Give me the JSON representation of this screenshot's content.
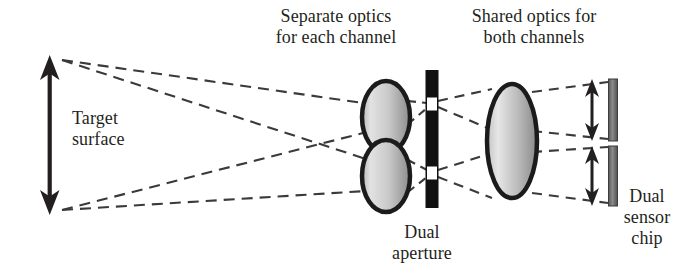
{
  "figure": {
    "type": "optical-ray-diagram",
    "background_color": "#ffffff",
    "ink_color": "#231f20",
    "lens_fill_light": "#d9d9d9",
    "lens_fill_dark": "#8c8c8c",
    "aperture_bar_color": "#111111",
    "aperture_slit_color": "#ffffff",
    "sensor_bar_color": "#6e6e6e",
    "ray_style": "dashed"
  },
  "labels": {
    "separate_optics": "Separate optics\nfor each channel",
    "shared_optics": "Shared optics for\nboth channels",
    "target_surface": "Target\nsurface",
    "dual_aperture": "Dual\naperture",
    "dual_sensor_chip": "Dual\nsensor\nchip"
  },
  "components": [
    {
      "name": "target-surface-arrow",
      "kind": "double-headed-arrow",
      "x": 50,
      "y_top": 58,
      "y_bottom": 212
    },
    {
      "name": "separate-optics-lens-upper",
      "kind": "ellipse-lens",
      "cx": 386,
      "cy": 117,
      "rx": 24,
      "ry": 36
    },
    {
      "name": "separate-optics-lens-lower",
      "kind": "ellipse-lens",
      "cx": 386,
      "cy": 176,
      "rx": 24,
      "ry": 36
    },
    {
      "name": "dual-aperture-bar",
      "kind": "opaque-bar",
      "cx": 432,
      "y_top": 70,
      "y_bottom": 208,
      "width": 13
    },
    {
      "name": "aperture-slit-upper",
      "kind": "slit",
      "cx": 432,
      "cy": 104,
      "width": 11,
      "height": 14
    },
    {
      "name": "aperture-slit-lower",
      "kind": "slit",
      "cx": 432,
      "cy": 173,
      "width": 11,
      "height": 14
    },
    {
      "name": "shared-optics-lens",
      "kind": "ellipse-lens",
      "cx": 512,
      "cy": 141,
      "rx": 25,
      "ry": 57
    },
    {
      "name": "sensor-bar-upper",
      "kind": "sensor-bar",
      "cx": 613,
      "y_top": 79,
      "y_bottom": 141,
      "width": 9
    },
    {
      "name": "sensor-bar-lower",
      "kind": "sensor-bar",
      "cx": 613,
      "y_top": 146,
      "y_bottom": 206,
      "width": 9
    },
    {
      "name": "sensor-extent-arrow-upper",
      "kind": "double-headed-arrow",
      "x": 592,
      "y_top": 81,
      "y_bottom": 139
    },
    {
      "name": "sensor-extent-arrow-lower",
      "kind": "double-headed-arrow",
      "x": 592,
      "y_top": 148,
      "y_bottom": 204
    }
  ],
  "rays": [
    {
      "name": "ray-top-to-upper-lens-top",
      "points": "62,60 362,104"
    },
    {
      "name": "ray-top-to-lower-lens-top",
      "points": "62,60 364,158"
    },
    {
      "name": "ray-bottom-to-upper-lens-bottom",
      "points": "62,210 362,134"
    },
    {
      "name": "ray-bottom-to-lower-lens-bottom",
      "points": "62,210 364,190"
    },
    {
      "name": "ray-upper-lens-to-slit-upper",
      "points": "410,104 426,104"
    },
    {
      "name": "ray-upper-lens-to-slit-upper-b",
      "points": "410,122 426,107"
    },
    {
      "name": "ray-lower-lens-to-slit-lower",
      "points": "410,162 426,170"
    },
    {
      "name": "ray-lower-lens-to-slit-lower-b",
      "points": "410,190 426,176"
    },
    {
      "name": "ray-slit-upper-to-shared-lens-top",
      "points": "438,102 489,88"
    },
    {
      "name": "ray-slit-upper-to-shared-lens-mid",
      "points": "438,106 489,128"
    },
    {
      "name": "ray-slit-lower-to-shared-lens-mid",
      "points": "438,170 489,154"
    },
    {
      "name": "ray-slit-lower-to-shared-lens-bottom",
      "points": "438,176 489,196"
    },
    {
      "name": "ray-shared-lens-to-sensor-upper-top",
      "points": "535,92 606,82"
    },
    {
      "name": "ray-shared-lens-to-sensor-upper-bottom",
      "points": "535,130 606,138"
    },
    {
      "name": "ray-shared-lens-to-sensor-lower-top",
      "points": "535,152 606,148"
    },
    {
      "name": "ray-shared-lens-to-sensor-lower-bottom",
      "points": "535,192 606,202"
    }
  ]
}
